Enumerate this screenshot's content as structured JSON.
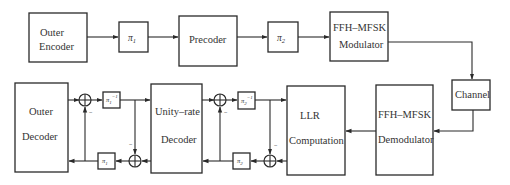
{
  "diagram": {
    "transmitter": {
      "outer_encoder": {
        "line1": "Outer",
        "line2": "Encoder"
      },
      "interleaver1": {
        "symbol": "π",
        "sub": "1"
      },
      "precoder": {
        "label": "Precoder"
      },
      "interleaver2": {
        "symbol": "π",
        "sub": "2"
      },
      "modulator": {
        "line1": "FFH–MFSK",
        "line2": "Modulator"
      }
    },
    "channel": {
      "label": "Channel"
    },
    "receiver": {
      "demodulator": {
        "line1": "FFH–MFSK",
        "line2": "Demodulator"
      },
      "llr": {
        "line1": "LLR",
        "line2": "Computation"
      },
      "deinterleaver2": {
        "symbol": "π",
        "sub": "2",
        "sup": "−1"
      },
      "interleaver2_fb": {
        "symbol": "π",
        "sub": "2"
      },
      "unity_rate_decoder": {
        "line1": "Unity–rate",
        "line2": "Decoder"
      },
      "deinterleaver1": {
        "symbol": "π",
        "sub": "1",
        "sup": "−1"
      },
      "interleaver1_fb": {
        "symbol": "π",
        "sub": "1"
      },
      "outer_decoder": {
        "line1": "Outer",
        "line2": "Decoder"
      },
      "minus_sign": "−"
    }
  }
}
